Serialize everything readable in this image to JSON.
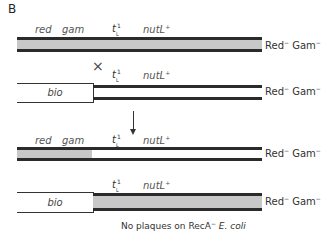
{
  "figure": {
    "panel_label": "B",
    "colors": {
      "strand": "#2b2b2b",
      "fill_gray": "#c8c8c8",
      "text": "#333333"
    },
    "rows": [
      {
        "gene_labels": {
          "red": "red",
          "gam": "gam",
          "tl_base": "t",
          "tl_sup": "1",
          "tl_sub": "L",
          "nutl": "nutL",
          "nutl_sup": "+"
        },
        "phenotype": {
          "red": "Red",
          "red_sup": "−",
          "gam": "Gam",
          "gam_sup": "−"
        }
      },
      {
        "cross_symbol": "×",
        "gene_labels": {
          "tl_base": "t",
          "tl_sup": "1",
          "tl_sub": "L",
          "nutl": "nutL",
          "nutl_sup": "+"
        },
        "bio_label": "bio",
        "phenotype": {
          "red": "Red",
          "red_sup": "−",
          "gam": "Gam",
          "gam_sup": "−"
        }
      },
      {
        "gene_labels": {
          "red": "red",
          "gam": "gam",
          "tl_base": "t",
          "tl_sup": "1",
          "tl_sub": "L",
          "nutl": "nutL",
          "nutl_sup": "+"
        },
        "phenotype": {
          "red": "Red",
          "red_sup": "−",
          "gam": "Gam",
          "gam_sup": "−"
        }
      },
      {
        "gene_labels": {
          "tl_base": "t",
          "tl_sup": "1",
          "tl_sub": "L",
          "nutl": "nutL",
          "nutl_sup": "+"
        },
        "bio_label": "bio",
        "phenotype": {
          "red": "Red",
          "red_sup": "−",
          "gam": "Gam",
          "gam_sup": "−"
        }
      }
    ],
    "caption": {
      "prefix": "No plaques on RecA",
      "sup": "−",
      "organism": "E. coli"
    }
  }
}
